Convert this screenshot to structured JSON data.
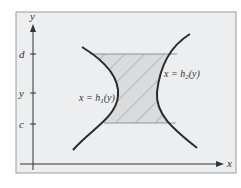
{
  "figure": {
    "frame": {
      "background": "#eceeef",
      "border": "#9a9a9a"
    },
    "axes": {
      "x_label": "x",
      "y_label": "y",
      "color": "#333333"
    },
    "ticks": [
      {
        "label": "d",
        "y": 54
      },
      {
        "label": "y",
        "y": 93
      },
      {
        "label": "c",
        "y": 124
      }
    ],
    "curves": [
      {
        "id": "h1",
        "label": "x = h",
        "sub": "1",
        "arg": "(y)",
        "color": "#2a2a2a"
      },
      {
        "id": "h2",
        "label": "x = h",
        "sub": "2",
        "arg": "(y)",
        "color": "#2a2a2a"
      }
    ],
    "region": {
      "fill": "#d9dbdc",
      "hatch": "#8a8a8a",
      "edge": "#8a8a8a"
    }
  }
}
